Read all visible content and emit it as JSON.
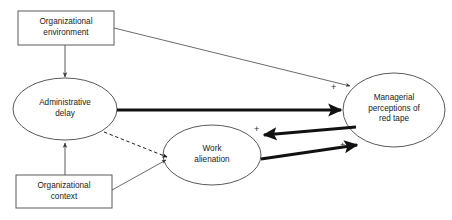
{
  "diagram": {
    "type": "path-model",
    "background_color": "#ffffff",
    "line_color": "#4a4a4a",
    "bold_line_color": "#1a1a1a",
    "text_color": "#1a1a1a",
    "nodes": [
      {
        "id": "organizational-environment",
        "shape": "rectangle",
        "label": "Organizational\nenvironment",
        "x": 18,
        "y": 11,
        "width": 96,
        "height": 34
      },
      {
        "id": "administrative-delay",
        "shape": "ellipse",
        "label": "Administrative\ndelay",
        "cx": 65,
        "cy": 109,
        "rx": 52,
        "ry": 31
      },
      {
        "id": "organizational-context",
        "shape": "rectangle",
        "label": "Organizational\ncontext",
        "x": 16,
        "y": 175,
        "width": 96,
        "height": 33
      },
      {
        "id": "work-alienation",
        "shape": "ellipse",
        "label": "Work\nalienation",
        "cx": 212,
        "cy": 155,
        "rx": 49,
        "ry": 30
      },
      {
        "id": "managerial-perceptions-of-red-tape",
        "shape": "ellipse",
        "label": "Managerial\nperceptions of\nred tape",
        "cx": 394,
        "cy": 110,
        "rx": 51,
        "ry": 37
      }
    ],
    "edges": [
      {
        "id": "env-to-delay",
        "from": "organizational-environment",
        "to": "administrative-delay",
        "style": "solid",
        "weight": "thin",
        "arrow": "single"
      },
      {
        "id": "env-to-red-tape",
        "from": "organizational-environment",
        "to": "managerial-perceptions-of-red-tape",
        "style": "solid",
        "weight": "thin",
        "arrow": "single",
        "sign": "+"
      },
      {
        "id": "context-to-delay",
        "from": "organizational-context",
        "to": "administrative-delay",
        "style": "solid",
        "weight": "thin",
        "arrow": "single"
      },
      {
        "id": "context-to-alienation",
        "from": "organizational-context",
        "to": "work-alienation",
        "style": "solid",
        "weight": "thin",
        "arrow": "single"
      },
      {
        "id": "delay-to-red-tape",
        "from": "administrative-delay",
        "to": "managerial-perceptions-of-red-tape",
        "style": "solid",
        "weight": "bold",
        "arrow": "single"
      },
      {
        "id": "delay-to-alienation",
        "from": "administrative-delay",
        "to": "work-alienation",
        "style": "dashed",
        "weight": "thin",
        "arrow": "single"
      },
      {
        "id": "red-tape-to-alienation",
        "from": "managerial-perceptions-of-red-tape",
        "to": "work-alienation",
        "style": "solid",
        "weight": "bold",
        "arrow": "single",
        "sign": "+"
      },
      {
        "id": "alienation-to-red-tape",
        "from": "work-alienation",
        "to": "managerial-perceptions-of-red-tape",
        "style": "solid",
        "weight": "bold",
        "arrow": "single",
        "sign": "+"
      }
    ],
    "signs": [
      {
        "id": "plus-env-red-tape",
        "text": "+",
        "x": 331,
        "y": 83
      },
      {
        "id": "plus-red-tape-alienation",
        "text": "+",
        "x": 254,
        "y": 128
      },
      {
        "id": "plus-alienation-red-tape",
        "text": "+",
        "x": 340,
        "y": 142
      }
    ]
  }
}
